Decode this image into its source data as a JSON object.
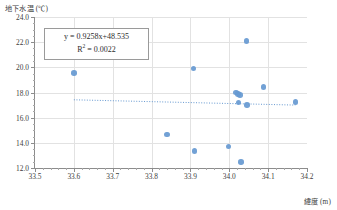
{
  "chart_data": {
    "type": "scatter",
    "title": "",
    "xlabel": "緯度 (m)",
    "ylabel": "地下水温 (℃)",
    "xlim": [
      33.5,
      34.2
    ],
    "ylim": [
      12.0,
      24.0
    ],
    "xticks": [
      "33.5",
      "33.6",
      "33.7",
      "33.8",
      "33.9",
      "34.0",
      "34.1",
      "34.2"
    ],
    "xtick_values": [
      33.5,
      33.6,
      33.7,
      33.8,
      33.9,
      34.0,
      34.1,
      34.2
    ],
    "yticks": [
      "12.0",
      "14.0",
      "16.0",
      "18.0",
      "20.0",
      "22.0",
      "24.0"
    ],
    "ytick_values": [
      12.0,
      14.0,
      16.0,
      18.0,
      20.0,
      22.0,
      24.0
    ],
    "grid": true,
    "legend": "none",
    "marker_color": "#6699d1",
    "trendline_color": "#6699d1",
    "trendline_style": "dotted",
    "points": [
      {
        "x": 33.6,
        "y": 19.55
      },
      {
        "x": 33.84,
        "y": 14.65
      },
      {
        "x": 33.908,
        "y": 19.9
      },
      {
        "x": 33.91,
        "y": 13.33
      },
      {
        "x": 33.998,
        "y": 13.7
      },
      {
        "x": 34.018,
        "y": 18.0
      },
      {
        "x": 34.022,
        "y": 17.88
      },
      {
        "x": 34.024,
        "y": 17.2
      },
      {
        "x": 34.028,
        "y": 17.8
      },
      {
        "x": 34.03,
        "y": 12.5
      },
      {
        "x": 34.044,
        "y": 22.1
      },
      {
        "x": 34.046,
        "y": 17.0
      },
      {
        "x": 34.088,
        "y": 18.45
      },
      {
        "x": 34.17,
        "y": 17.25
      }
    ],
    "trendline": {
      "slope": 0.9258,
      "intercept": 48.535,
      "r_squared": 0.0022,
      "x_start": 33.6,
      "y_start": 17.42,
      "x_end": 34.17,
      "y_end": 17.0
    },
    "annotation": {
      "equation_prefix": "y = ",
      "equation": "y = 0.9258x+48.535",
      "r2_label": "R",
      "r2_exponent": "2",
      "r2_value": " = 0.0022"
    }
  }
}
